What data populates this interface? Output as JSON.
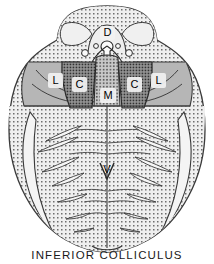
{
  "figure": {
    "caption": "INFERIOR COLLICULUS",
    "type": "anatomical-cross-section",
    "background_color": "#ffffff",
    "outline_color": "#3a3a3a"
  },
  "labels": {
    "dorsal": "D",
    "lateral_left": "L",
    "lateral_right": "L",
    "central_left": "C",
    "central_right": "C",
    "medial": "M",
    "ventral": "V"
  },
  "regions": [
    {
      "key": "dorsal_cap",
      "label": "D",
      "fill": "#e3e3e3",
      "texture": "fine-stipple"
    },
    {
      "key": "lateral_left",
      "label": "L",
      "fill": "#b4b4b4",
      "texture": "plain-gray"
    },
    {
      "key": "lateral_right",
      "label": "L",
      "fill": "#b4b4b4",
      "texture": "plain-gray"
    },
    {
      "key": "central_left",
      "label": "C",
      "fill": "#8e8e8e",
      "texture": "dense-stipple"
    },
    {
      "key": "central_right",
      "label": "C",
      "fill": "#8e8e8e",
      "texture": "dense-stipple"
    },
    {
      "key": "medial",
      "label": "M",
      "fill": "#a8a8a8",
      "texture": "medium-stipple"
    },
    {
      "key": "ventral_body",
      "label": "V",
      "fill": "#ededed",
      "texture": "fine-stipple"
    }
  ],
  "colors": {
    "stipple_dot": "#6e6e6e",
    "dense_dot": "#3c3c3c",
    "label_halo": "#f2f2f2",
    "line": "#3a3a3a"
  },
  "fiber_bundles": {
    "left_count": 7,
    "right_count": 7,
    "description": "elongated lens-shaped fiber bundle marks"
  }
}
